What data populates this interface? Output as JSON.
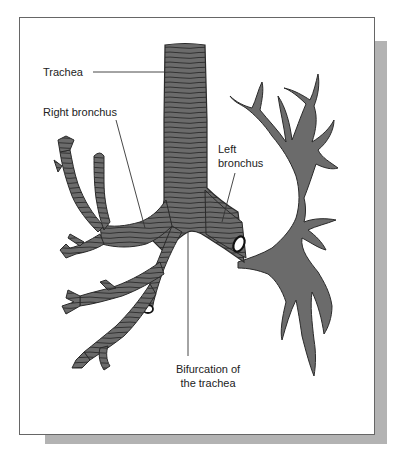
{
  "figure": {
    "type": "anatomical illustration",
    "colors": {
      "airway_fill": "#6b6b6b",
      "airway_outline": "#2a2a2a",
      "cartilage_rings": "#2a2a2a",
      "frame_border": "#666666",
      "shadow": "#b3b3b3",
      "background": "#ffffff"
    }
  },
  "labels": {
    "trachea": "Trachea",
    "right_bronchus": "Right bronchus",
    "left_bronchus_line1": "Left",
    "left_bronchus_line2": "bronchus",
    "bifurcation_line1": "Bifurcation of",
    "bifurcation_line2": "the trachea"
  }
}
